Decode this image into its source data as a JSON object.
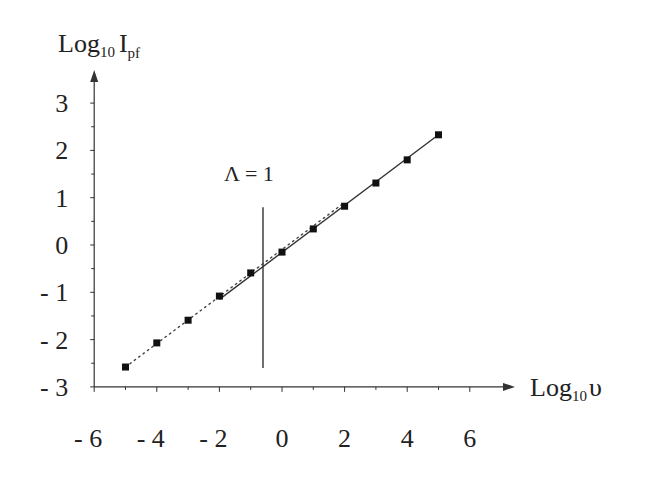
{
  "chart_data": {
    "type": "line",
    "title": "",
    "xlabel": "Log10 υ",
    "ylabel": "Log10 Ipf",
    "xlabel_parts": {
      "main": "Log",
      "sub": "10",
      "var": "υ"
    },
    "ylabel_parts": {
      "main": "Log",
      "sub": "10",
      "var": "I",
      "var_sub": "pf"
    },
    "xlim": [
      -6,
      7
    ],
    "ylim": [
      -3,
      3.6
    ],
    "x_ticks": [
      -6,
      -4,
      -2,
      0,
      2,
      4,
      6
    ],
    "x_tick_labels": [
      "- 6",
      "- 4",
      "- 2",
      "0",
      "2",
      "4",
      "6"
    ],
    "y_ticks": [
      3,
      2,
      1,
      0,
      -1,
      -2,
      -3
    ],
    "y_tick_labels": [
      "3",
      "2",
      "1",
      "0",
      "- 1",
      "- 2",
      "- 3"
    ],
    "grid": false,
    "legend": null,
    "annotation": {
      "text": "Λ = 1",
      "x": -0.6,
      "line_y_range": [
        -2.6,
        0.8
      ]
    },
    "series": [
      {
        "name": "data points",
        "style": "markers + dotted",
        "x": [
          -5,
          -4,
          -3,
          -2,
          -1,
          0,
          1,
          2,
          3,
          4,
          5
        ],
        "y": [
          -2.58,
          -2.07,
          -1.59,
          -1.08,
          -0.59,
          -0.15,
          0.34,
          0.82,
          1.31,
          1.8,
          2.33
        ]
      },
      {
        "name": "dotted fit (low Λ)",
        "style": "dotted",
        "x": [
          -5,
          2
        ],
        "y": [
          -2.58,
          0.9
        ]
      },
      {
        "name": "solid fit (high Λ)",
        "style": "solid",
        "x": [
          -2,
          5
        ],
        "y": [
          -1.15,
          2.33
        ]
      }
    ]
  }
}
